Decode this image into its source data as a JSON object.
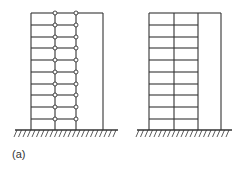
{
  "figure": {
    "caption": "(a)",
    "colors": {
      "line": "#333333",
      "background": "#ffffff",
      "hinge_fill": "#ffffff"
    },
    "ground_y": 130,
    "levels_y": [
      13,
      25,
      37,
      48,
      60,
      72,
      84,
      95,
      107,
      119
    ],
    "frames": [
      {
        "name": "hinged-frame",
        "columns_x": [
          31,
          55,
          76
        ],
        "wall_x": 103,
        "ground_x": [
          15,
          118
        ],
        "hinged_middle_bay": true
      },
      {
        "name": "rigid-frame",
        "columns_x": [
          149,
          174,
          198
        ],
        "wall_x": 221,
        "ground_x": [
          137,
          232
        ],
        "hinged_middle_bay": false
      }
    ]
  }
}
